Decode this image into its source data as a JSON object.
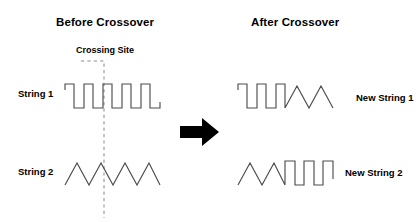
{
  "diagram": {
    "kind": "genetic-crossover-schematic",
    "background_color": "#ffffff",
    "wave_stroke_color": "#4d4d4d",
    "dash_stroke_color": "#8c8c8c",
    "arrow_color": "#000000",
    "text_color": "#000000"
  },
  "titles": {
    "before": "Before Crossover",
    "after": "After Crossover"
  },
  "annotations": {
    "crossing_site": "Crossing Site"
  },
  "left_panel": {
    "strings": [
      {
        "label": "String 1",
        "waveform": "square",
        "points": "0,6 0,0 9,0 9,24 19,24 19,0 28,0 28,24 38,24 38,0 47,0 47,24 57,24 57,0 66,0 66,24 76,24 76,0 85,0 85,24 95,24 95,18"
      },
      {
        "label": "String 2",
        "waveform": "triangle",
        "points": "0,24 12,2 24,24 36,2 48,24 60,2 72,24 84,2 95,24"
      }
    ]
  },
  "right_panel": {
    "strings": [
      {
        "label": "New String 1",
        "waveform": "square-then-triangle",
        "points": "0,6 0,0 9,0 9,24 19,24 19,0 28,0 28,24 38,24 38,0 47,0 47,24 59,2 71,24 83,2 95,24"
      },
      {
        "label": "New String 2",
        "waveform": "triangle-then-square",
        "points": "0,24 12,2 24,24 36,2 47,24 47,0 57,0 57,24 66,24 66,0 76,0 76,24 85,24 85,0 95,0 95,18"
      }
    ]
  },
  "arrow": {
    "name": "crossover-arrow",
    "direction": "right"
  }
}
